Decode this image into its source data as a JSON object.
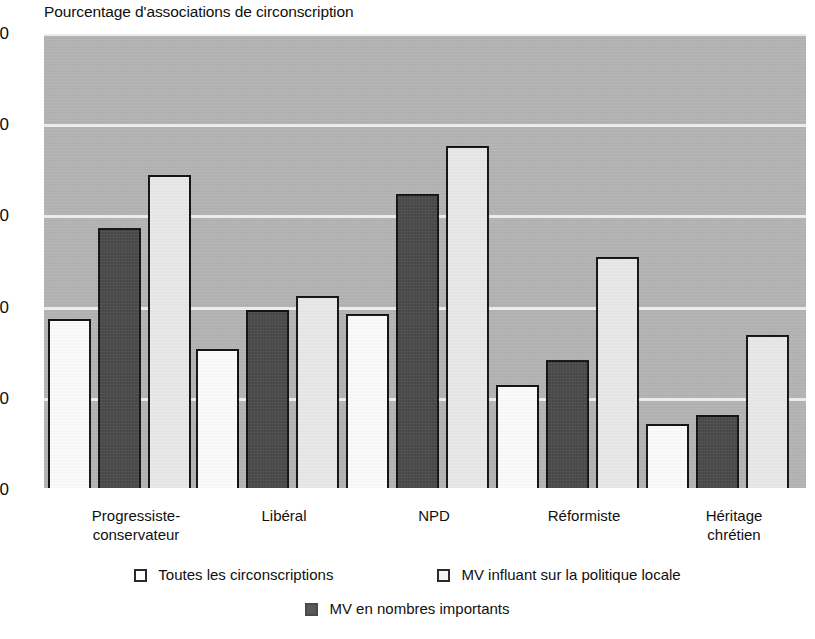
{
  "chart_data": {
    "type": "bar",
    "title": "Pourcentage d'associations de circonscription",
    "xlabel": "",
    "ylabel": "",
    "ylim": [
      0,
      100
    ],
    "yticks": [
      0,
      20,
      40,
      60,
      80,
      100
    ],
    "grid": true,
    "legend_position": "bottom",
    "categories": [
      "Progressiste-\nconservateur",
      "Libéral",
      "NPD",
      "Réformiste",
      "Héritage\nchrétien"
    ],
    "series": [
      {
        "name": "Toutes les circonscriptions",
        "color": "#ffffff",
        "values": [
          37.5,
          31,
          38.5,
          23,
          14.5
        ]
      },
      {
        "name": "MV en nombres importants",
        "color": "#4b4b4b",
        "values": [
          57.5,
          39.5,
          65,
          28.5,
          16.5
        ]
      },
      {
        "name": "MV influant sur la politique locale",
        "color": "#ececec",
        "values": [
          69,
          42.5,
          75.5,
          51,
          34
        ]
      }
    ]
  },
  "axis": {
    "y_tick_labels": [
      "100",
      "80",
      "60",
      "40",
      "20",
      "0"
    ]
  },
  "legend": {
    "row1": [
      {
        "label": "Toutes les circonscriptions",
        "swatch": "white-square-icon",
        "series": 0
      },
      {
        "label": "MV influant sur la politique locale",
        "swatch": "light-gray-square-icon",
        "series": 2
      }
    ],
    "row2": [
      {
        "label": "MV en nombres importants",
        "swatch": "dark-gray-square-icon",
        "series": 1
      }
    ]
  }
}
